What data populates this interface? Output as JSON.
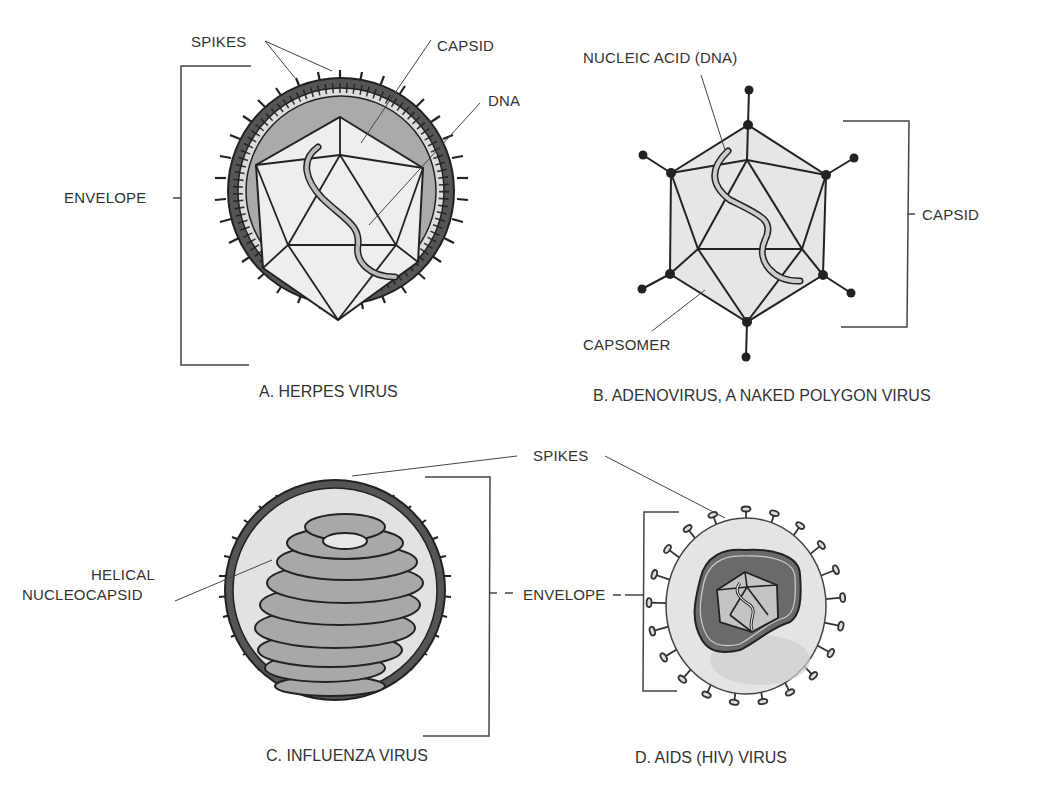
{
  "figure": {
    "panels": [
      {
        "id": "A",
        "caption": "A. HERPES VIRUS",
        "labels": {
          "spikes": "SPIKES",
          "capsid": "CAPSID",
          "dna": "DNA",
          "envelope": "ENVELOPE"
        }
      },
      {
        "id": "B",
        "caption": "B. ADENOVIRUS, A NAKED POLYGON VIRUS",
        "labels": {
          "nucleic_acid": "NUCLEIC ACID (DNA)",
          "capsid": "CAPSID",
          "capsomer": "CAPSOMER"
        }
      },
      {
        "id": "C",
        "caption": "C. INFLUENZA VIRUS",
        "labels": {
          "helical_1": "HELICAL",
          "helical_2": "NUCLEOCAPSID"
        }
      },
      {
        "id": "D",
        "caption": "D. AIDS (HIV) VIRUS",
        "labels": {}
      }
    ],
    "shared_labels": {
      "spikes": "SPIKES",
      "envelope": "ENVELOPE"
    },
    "colors": {
      "envelope_dark": "#555555",
      "fill_light": "#e8e8e8",
      "fill_mid": "#b0b0b0",
      "line": "#222222"
    }
  }
}
